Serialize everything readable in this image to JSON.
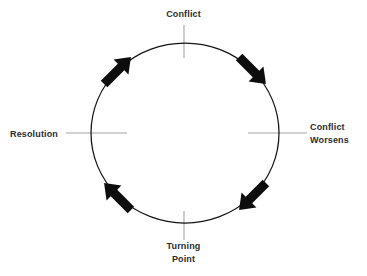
{
  "diagram": {
    "type": "cycle-diagram",
    "background_color": "#ffffff",
    "stroke_color": "#1a1a1a",
    "tick_color": "#9a9a9a",
    "text_color": "#2b2b2b",
    "circle": {
      "center_x": 185,
      "center_y": 133,
      "radius_x": 94,
      "radius_y": 90,
      "stroke_width": 1.2
    },
    "nodes": [
      {
        "id": "conflict",
        "position": "top",
        "angle_deg": 270,
        "lines": [
          "Conflict"
        ]
      },
      {
        "id": "conflict-worsens",
        "position": "right",
        "angle_deg": 0,
        "lines": [
          "Conflict",
          "Worsens"
        ]
      },
      {
        "id": "turning-point",
        "position": "bottom",
        "angle_deg": 90,
        "lines": [
          "Turning",
          "Point"
        ]
      },
      {
        "id": "resolution",
        "position": "left",
        "angle_deg": 180,
        "lines": [
          "Resolution"
        ]
      }
    ],
    "arrows": [
      {
        "id": "arrow-top-right",
        "angle_deg": 315,
        "direction": "clockwise"
      },
      {
        "id": "arrow-bottom-right",
        "angle_deg": 45,
        "direction": "clockwise"
      },
      {
        "id": "arrow-bottom-left",
        "angle_deg": 135,
        "direction": "clockwise"
      },
      {
        "id": "arrow-top-left",
        "angle_deg": 225,
        "direction": "clockwise"
      }
    ],
    "ticks": [
      {
        "id": "tick-top",
        "orientation": "vertical",
        "x1": 184,
        "y1": 25,
        "x2": 184,
        "y2": 58
      },
      {
        "id": "tick-right",
        "orientation": "horizontal",
        "x1": 248,
        "y1": 133,
        "x2": 307,
        "y2": 133
      },
      {
        "id": "tick-bottom",
        "orientation": "vertical",
        "x1": 184,
        "y1": 211,
        "x2": 184,
        "y2": 240
      },
      {
        "id": "tick-left",
        "orientation": "horizontal",
        "x1": 66,
        "y1": 133,
        "x2": 127,
        "y2": 133
      }
    ]
  }
}
